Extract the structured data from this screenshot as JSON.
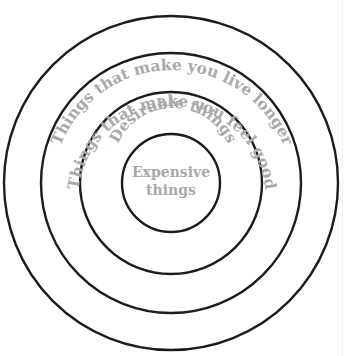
{
  "diagram": {
    "type": "concentric-circles",
    "center": {
      "x": 171,
      "y": 183
    },
    "stroke_color": "#1c1c1c",
    "text_color": "#a9a9a9",
    "rings": [
      {
        "radius": 167,
        "label": "Things that make you live longer"
      },
      {
        "radius": 130,
        "label": "Things that make you feel good"
      },
      {
        "radius": 91,
        "label": "Desirable things"
      },
      {
        "radius": 49,
        "label": ""
      }
    ],
    "center_label": {
      "line1": "Expensive",
      "line2": "things"
    }
  }
}
